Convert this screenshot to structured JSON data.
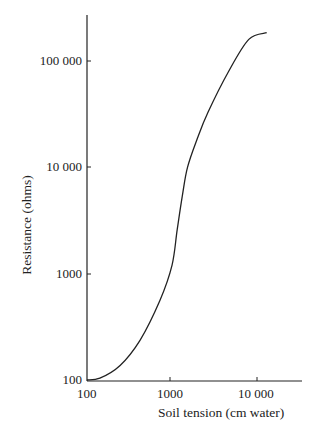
{
  "chart_data": {
    "type": "line",
    "title": "",
    "xlabel": "Soil tension (cm water)",
    "ylabel": "Resistance (ohms)",
    "xscale": "log",
    "yscale": "log",
    "xlim": [
      100,
      30000
    ],
    "ylim": [
      100,
      300000
    ],
    "x_ticks": [
      "100",
      "1000",
      "10 000"
    ],
    "y_ticks": [
      "100",
      "1000",
      "10 000",
      "100 000"
    ],
    "grid": false,
    "series": [
      {
        "name": "Resistance vs soil tension",
        "x": [
          100,
          142,
          245,
          420,
          720,
          1000,
          1150,
          1320,
          1520,
          2000,
          2650,
          4600,
          8000,
          13000
        ],
        "y": [
          100,
          104,
          137,
          236,
          560,
          1200,
          2600,
          5300,
          10000,
          19000,
          33000,
          79000,
          160000,
          185000
        ]
      }
    ]
  },
  "axes": {
    "y_tick_labels": [
      "100 000",
      "10 000",
      "1000",
      "100"
    ],
    "x_tick_labels": [
      "100",
      "1000",
      "10 000"
    ],
    "x_title": "Soil tension (cm water)",
    "y_title": "Resistance (ohms)"
  }
}
